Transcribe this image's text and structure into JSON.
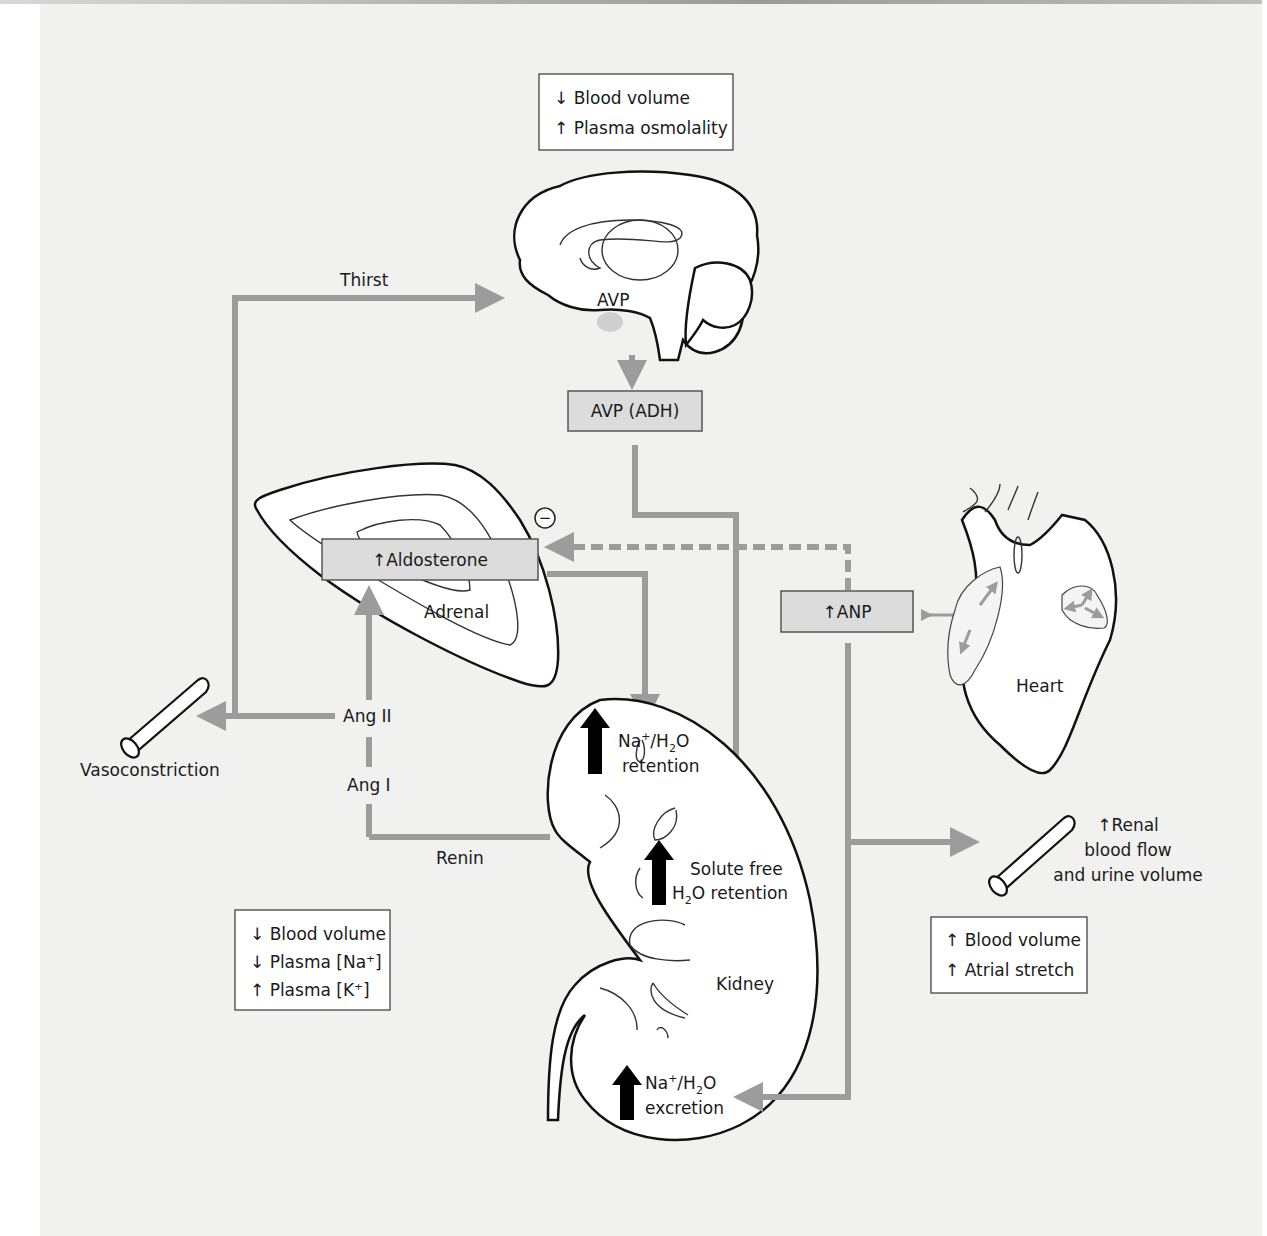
{
  "figure": {
    "type": "physiology-flow-diagram",
    "colors": {
      "background": "#f1f1f0",
      "connector": "#9c9c9c",
      "hormone_box_fill": "#dcdcdc",
      "organ_outline": "#111111",
      "effect_arrow": "#000000"
    }
  },
  "stimulus_boxes": {
    "brain_trigger": {
      "lines": [
        "↓ Blood volume",
        "↑ Plasma osmolality"
      ]
    },
    "renin_trigger": {
      "lines": [
        "↓ Blood volume",
        "↓ Plasma [Na⁺]",
        "↑ Plasma [K⁺]"
      ]
    },
    "heart_trigger": {
      "lines": [
        "↑ Blood volume",
        "↑ Atrial stretch"
      ]
    }
  },
  "hormones": {
    "avp": "AVP (ADH)",
    "aldosterone": "↑Aldosterone",
    "anp": "↑ANP"
  },
  "organs": {
    "brain": {
      "label": "AVP"
    },
    "adrenal": {
      "label": "Adrenal"
    },
    "heart": {
      "label": "Heart"
    },
    "kidney": {
      "label": "Kidney"
    }
  },
  "pathway_labels": {
    "thirst": "Thirst",
    "ang2": "Ang II",
    "ang1": "Ang I",
    "renin": "Renin",
    "vasoconstriction": "Vasoconstriction",
    "inhibition_symbol": "−"
  },
  "effects": {
    "na_retention": {
      "line1_a": "Na",
      "line1_sup": "+",
      "line1_b": "/H",
      "line1_sub": "2",
      "line1_c": "O",
      "line2": "retention"
    },
    "water_retention": {
      "line1": "Solute free",
      "line2_a": "H",
      "line2_sub": "2",
      "line2_b": "O retention"
    },
    "na_excretion": {
      "line1_a": "Na",
      "line1_sup": "+",
      "line1_b": "/H",
      "line1_sub": "2",
      "line1_c": "O",
      "line2": "excretion"
    },
    "renal_flow": {
      "lines": [
        "↑Renal",
        "blood flow",
        "and urine volume"
      ]
    }
  }
}
